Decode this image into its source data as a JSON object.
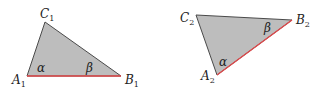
{
  "diagram": {
    "fill_color": "#bdbdbd",
    "edge_color": "#4a4a4a",
    "highlight_color": "#e0484a",
    "triangles": [
      {
        "id": "triangle-1",
        "vertices": {
          "A": {
            "label": "A",
            "sub": "1",
            "x": 27,
            "y": 76
          },
          "B": {
            "label": "B",
            "sub": "1",
            "x": 121,
            "y": 76
          },
          "C": {
            "label": "C",
            "sub": "1",
            "x": 45,
            "y": 22
          }
        },
        "highlighted_side": "AB",
        "angles": [
          {
            "vertex": "A",
            "symbol": "α"
          },
          {
            "vertex": "B",
            "symbol": "β"
          }
        ]
      },
      {
        "id": "triangle-2",
        "vertices": {
          "A": {
            "label": "A",
            "sub": "2",
            "x": 217,
            "y": 75
          },
          "B": {
            "label": "B",
            "sub": "2",
            "x": 292,
            "y": 20
          },
          "C": {
            "label": "C",
            "sub": "2",
            "x": 196,
            "y": 15
          }
        },
        "highlighted_side": "AB",
        "angles": [
          {
            "vertex": "A",
            "symbol": "α"
          },
          {
            "vertex": "B",
            "symbol": "β"
          }
        ]
      }
    ]
  }
}
